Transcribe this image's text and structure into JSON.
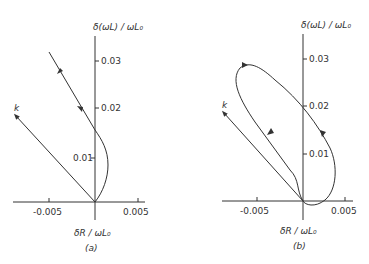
{
  "figure": {
    "panels": [
      {
        "caption": "(a)",
        "y_axis_label": "δ(ωL) / ωL₀",
        "x_axis_label": "δR / ωL₀",
        "y_ticks": [
          "0.01",
          "0.02",
          "0.03"
        ],
        "x_ticks": [
          "-0.005",
          "0.005"
        ],
        "curve_label": "k"
      },
      {
        "caption": "(b)",
        "y_axis_label": "δ(ωL) / ωL₀",
        "x_axis_label": "δR / ωL₀",
        "y_ticks": [
          "0.01",
          "0.02",
          "0.03"
        ],
        "x_ticks": [
          "-0.005",
          "0.005"
        ],
        "curve_label": "k"
      }
    ],
    "colors": {
      "line": "#333333",
      "background": "#ffffff"
    }
  }
}
